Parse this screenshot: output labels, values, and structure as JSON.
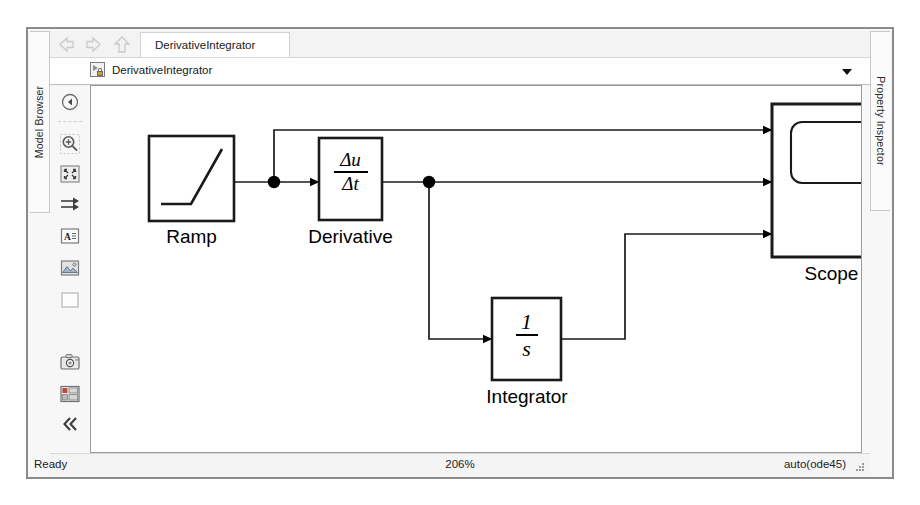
{
  "window": {
    "model_browser_tab": "Model Browser",
    "property_inspector_tab": "Property Inspector"
  },
  "nav": {
    "back_icon": "back-arrow-icon",
    "forward_icon": "forward-arrow-icon",
    "up_icon": "up-arrow-icon",
    "active_tab": "DerivativeIntegrator"
  },
  "breadcrumb": {
    "model_icon": "model-locked-icon",
    "label": "DerivativeIntegrator",
    "dropdown_icon": "chevron-down-icon"
  },
  "palette": {
    "items": [
      {
        "name": "navigate-back-icon",
        "tooltip": "Navigate back"
      },
      {
        "name": "zoom-in-icon",
        "tooltip": "Zoom in"
      },
      {
        "name": "fit-to-view-icon",
        "tooltip": "Fit to view"
      },
      {
        "name": "signal-routing-icon",
        "tooltip": "Signal routing"
      },
      {
        "name": "annotation-text-icon",
        "tooltip": "Add annotation"
      },
      {
        "name": "image-area-icon",
        "tooltip": "Add image"
      },
      {
        "name": "blank-area-icon",
        "tooltip": "Add area"
      },
      {
        "name": "camera-snapshot-icon",
        "tooltip": "Snapshot"
      },
      {
        "name": "layout-panels-icon",
        "tooltip": "Layout"
      },
      {
        "name": "collapse-palette-icon",
        "tooltip": "Hide palette"
      }
    ]
  },
  "diagram": {
    "blocks": [
      {
        "id": "ramp",
        "label": "Ramp",
        "glyph": "ramp-slope-icon"
      },
      {
        "id": "derivative",
        "label": "Derivative",
        "numerator": "Δu",
        "denominator": "Δt"
      },
      {
        "id": "integrator",
        "label": "Integrator",
        "numerator": "1",
        "denominator": "s"
      },
      {
        "id": "scope",
        "label": "Scope",
        "glyph": "scope-screen-icon",
        "ports": 3
      }
    ],
    "signals": [
      {
        "from": "ramp",
        "to": "derivative",
        "label": ""
      },
      {
        "from": "ramp",
        "to": "scope.port1",
        "label": ""
      },
      {
        "from": "derivative",
        "to": "scope.port2",
        "label": ""
      },
      {
        "from": "derivative",
        "to": "integrator",
        "label": ""
      },
      {
        "from": "integrator",
        "to": "scope.port3",
        "label": ""
      }
    ]
  },
  "status": {
    "ready": "Ready",
    "zoom": "206%",
    "solver": "auto(ode45)"
  }
}
